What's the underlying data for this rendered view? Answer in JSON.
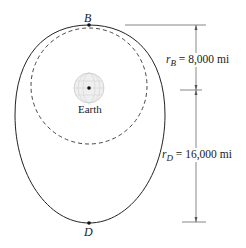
{
  "figure": {
    "points": {
      "B": {
        "label": "B"
      },
      "D": {
        "label": "D"
      }
    },
    "planet": {
      "label": "Earth"
    },
    "dimensions": {
      "rB": {
        "var": "r",
        "sub": "B",
        "value": "= 8,000 mi"
      },
      "rD": {
        "var": "r",
        "sub": "D",
        "value": "= 16,000 mi"
      }
    },
    "orbits": {
      "elliptical": {
        "style": "solid"
      },
      "circular": {
        "style": "dashed"
      }
    },
    "colors": {
      "line": "#222222",
      "dimension_line": "#555555",
      "earth": "#bbbbbb"
    }
  }
}
